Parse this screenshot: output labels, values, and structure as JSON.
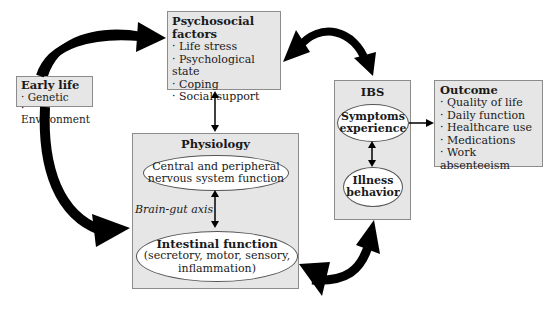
{
  "diagram": {
    "early_life": {
      "title": "Early life",
      "items": [
        "Genetic",
        "Environment"
      ]
    },
    "psychosocial": {
      "title": "Psychosocial factors",
      "items": [
        "Life stress",
        "Psychological state",
        "Coping",
        "Social support"
      ]
    },
    "physiology": {
      "title": "Physiology",
      "cns": {
        "line1": "Central and peripheral",
        "line2": "nervous system function"
      },
      "axis_label": "Brain-gut axis",
      "intestinal": {
        "title": "Intestinal function",
        "line1": "(secretory, motor, sensory,",
        "line2": "inflammation)"
      }
    },
    "ibs": {
      "title": "IBS",
      "symptoms": {
        "line1": "Symptoms",
        "line2": "experience"
      },
      "illness": {
        "line1": "Illness",
        "line2": "behavior"
      }
    },
    "outcome": {
      "title": "Outcome",
      "items": [
        "Quality of life",
        "Daily function",
        "Healthcare use",
        "Medications",
        "Work absenteeism"
      ]
    },
    "colors": {
      "box_fill": "#e6e6e6",
      "box_border": "#8c8c8c",
      "arrow": "#000000",
      "ellipse_fill": "#ffffff"
    }
  }
}
